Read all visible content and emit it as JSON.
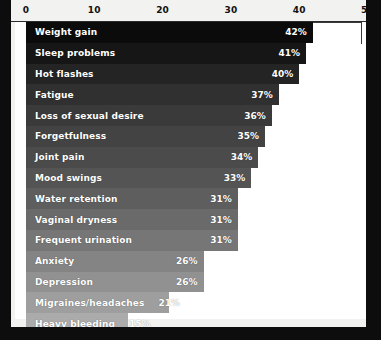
{
  "chart_data": {
    "type": "bar",
    "orientation": "horizontal",
    "title": "",
    "xlabel": "",
    "ylabel": "",
    "xlim": [
      0,
      50
    ],
    "grid": false,
    "legend": null,
    "axis_ticks": [
      {
        "value": 0,
        "label": "0"
      },
      {
        "value": 10,
        "label": "10"
      },
      {
        "value": 20,
        "label": "20"
      },
      {
        "value": 30,
        "label": "30"
      },
      {
        "value": 40,
        "label": "40"
      },
      {
        "value": 50,
        "label": "50"
      }
    ],
    "categories": [
      "Weight gain",
      "Sleep problems",
      "Hot flashes",
      "Fatigue",
      "Loss of sexual desire",
      "Forgetfulness",
      "Joint pain",
      "Mood swings",
      "Water retention",
      "Vaginal dryness",
      "Frequent urination",
      "Anxiety",
      "Depression",
      "Migraines/headaches",
      "Heavy bleeding"
    ],
    "values": [
      42,
      41,
      40,
      37,
      36,
      35,
      34,
      33,
      31,
      31,
      31,
      26,
      26,
      21,
      15
    ],
    "value_labels": [
      "42%",
      "41%",
      "40%",
      "37%",
      "36%",
      "35%",
      "34%",
      "33%",
      "31%",
      "31%",
      "31%",
      "26%",
      "26%",
      "21%",
      "15%"
    ],
    "bar_colors": [
      "#0b0b0b",
      "#161616",
      "#242424",
      "#303030",
      "#3a3a3a",
      "#434343",
      "#4b4b4b",
      "#545454",
      "#5e5e5e",
      "#6a6a6a",
      "#767676",
      "#848484",
      "#919191",
      "#9e9e9e",
      "#ababab"
    ],
    "value_label_color": "#ffffff",
    "category_label_color": "#ffffff",
    "plot_background": "#ffffff",
    "frame_background": "#0d0d0d"
  }
}
